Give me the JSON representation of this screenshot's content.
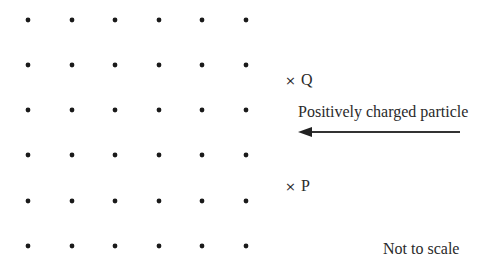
{
  "diagram": {
    "field_symbol": "dot (field out of page)",
    "dot_grid": {
      "columns_x": [
        28,
        72,
        115,
        159,
        202,
        246
      ],
      "rows_y": [
        20,
        65,
        110,
        155,
        201,
        246
      ],
      "dot_radius": 2.4,
      "color": "#1a1a1a"
    },
    "points": [
      {
        "marker": "×",
        "label": "Q"
      },
      {
        "marker": "×",
        "label": "P"
      }
    ],
    "particle": {
      "label": "Positively charged particle",
      "direction": "left",
      "arrow_color": "#333333"
    },
    "note": "Not to scale"
  }
}
